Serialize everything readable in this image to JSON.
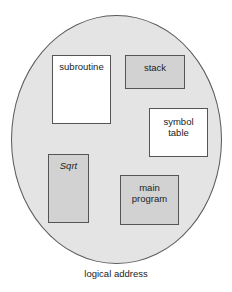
{
  "diagram": {
    "type": "logical-address-space",
    "caption": "logical address",
    "colors": {
      "space_fill": "#e4e4e4",
      "space_border": "#5a5a5a",
      "segment_border": "#555555",
      "white_segment": "#ffffff",
      "gray_segment": "#d2d2d2"
    },
    "segments": [
      {
        "id": "subroutine",
        "lines": [
          "subroutine"
        ],
        "fill": "white",
        "italic": false
      },
      {
        "id": "stack",
        "lines": [
          "stack"
        ],
        "fill": "gray",
        "italic": false
      },
      {
        "id": "symbol-table",
        "lines": [
          "symbol",
          "table"
        ],
        "fill": "white",
        "italic": false
      },
      {
        "id": "sqrt",
        "lines": [
          "Sqrt"
        ],
        "fill": "gray",
        "italic": true
      },
      {
        "id": "main-program",
        "lines": [
          "main",
          "program"
        ],
        "fill": "gray",
        "italic": false
      }
    ]
  }
}
